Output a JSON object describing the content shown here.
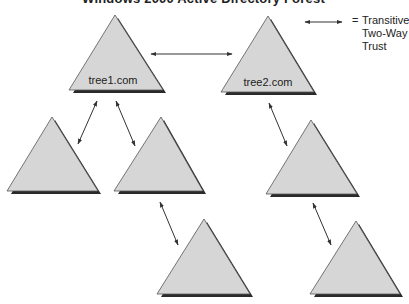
{
  "title": "Windows 2000 Active Directory Forest",
  "legend": {
    "symbol": "two-way-arrow",
    "equals": "=",
    "lines": [
      "Transitive",
      "Two-Way",
      "Trust"
    ]
  },
  "colors": {
    "triangle_fill": "#d6d6d6",
    "triangle_shadow": "#2a2a2a",
    "triangle_stroke": "#555555",
    "arrow": "#333333"
  },
  "trees": [
    {
      "id": "t1",
      "label": "tree1.com"
    },
    {
      "id": "t2",
      "label": "tree2.com"
    },
    {
      "id": "t3",
      "label": ""
    },
    {
      "id": "t4",
      "label": ""
    },
    {
      "id": "t5",
      "label": ""
    },
    {
      "id": "t6",
      "label": ""
    },
    {
      "id": "t7",
      "label": ""
    }
  ],
  "trusts": [
    {
      "from": "t1",
      "to": "t2",
      "type": "transitive-two-way"
    },
    {
      "from": "t1",
      "to": "t3",
      "type": "transitive-two-way"
    },
    {
      "from": "t1",
      "to": "t4",
      "type": "transitive-two-way"
    },
    {
      "from": "t2",
      "to": "t5",
      "type": "transitive-two-way"
    },
    {
      "from": "t4",
      "to": "t6",
      "type": "transitive-two-way"
    },
    {
      "from": "t5",
      "to": "t7",
      "type": "transitive-two-way"
    }
  ]
}
